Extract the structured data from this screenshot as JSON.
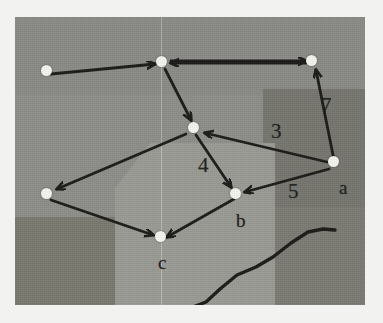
{
  "scene": {
    "description": "photograph of a hand-drawn directed graph on grey paper",
    "photo": {
      "x": 15,
      "y": 17,
      "w": 350,
      "h": 288
    },
    "background_color": "#8b8b89",
    "page_color": "#f2f2f0",
    "ink_color": "#1c1b19",
    "node_color": "#f4f4ee"
  },
  "shading_regions": [
    {
      "name": "base",
      "x": 0,
      "y": 0,
      "w": 350,
      "h": 288,
      "color": "#8d8d8a"
    },
    {
      "name": "upper-band",
      "x": 0,
      "y": 0,
      "w": 350,
      "h": 78,
      "color": "#8a8a86"
    },
    {
      "name": "right-dark-block",
      "x": 248,
      "y": 72,
      "w": 102,
      "h": 118,
      "color": "#76766f"
    },
    {
      "name": "right-lower-dark",
      "x": 248,
      "y": 190,
      "w": 102,
      "h": 98,
      "color": "#7b7b74"
    },
    {
      "name": "left-lower-dark",
      "x": 0,
      "y": 200,
      "w": 147,
      "h": 88,
      "color": "#79796f"
    },
    {
      "name": "center-light-band",
      "x": 122,
      "y": 130,
      "w": 128,
      "h": 158,
      "color": "#9a9a94"
    }
  ],
  "vertical_guide": {
    "name": "faint-vertical-crease",
    "x": 146
  },
  "graph": {
    "nodes": [
      {
        "id": "n1",
        "label": "",
        "x": 46,
        "y": 71
      },
      {
        "id": "n2",
        "label": "",
        "x": 161,
        "y": 62
      },
      {
        "id": "n3",
        "label": "",
        "x": 311,
        "y": 61
      },
      {
        "id": "n4",
        "label": "",
        "x": 193,
        "y": 128
      },
      {
        "id": "n5",
        "label": "a",
        "x": 333,
        "y": 162
      },
      {
        "id": "n6",
        "label": "",
        "x": 46,
        "y": 194
      },
      {
        "id": "n7",
        "label": "b",
        "x": 235,
        "y": 194
      },
      {
        "id": "n8",
        "label": "c",
        "x": 160,
        "y": 237
      }
    ],
    "node_labels": [
      {
        "name": "node-label-a",
        "text": "a",
        "x": 340,
        "y": 170
      },
      {
        "name": "node-label-b",
        "text": "b",
        "x": 237,
        "y": 203
      },
      {
        "name": "node-label-c",
        "text": "c",
        "x": 159,
        "y": 245
      }
    ],
    "edges": [
      {
        "from": "n1",
        "to": "n2",
        "weight": ""
      },
      {
        "from": "n3",
        "to": "n2",
        "weight": ""
      },
      {
        "from": "n2",
        "to": "n3",
        "weight": ""
      },
      {
        "from": "n2",
        "to": "n4",
        "weight": ""
      },
      {
        "from": "n5",
        "to": "n3",
        "weight": "7"
      },
      {
        "from": "n5",
        "to": "n4",
        "weight": "3"
      },
      {
        "from": "n5",
        "to": "n7",
        "weight": "5"
      },
      {
        "from": "n4",
        "to": "n7",
        "weight": "4"
      },
      {
        "from": "n4",
        "to": "n6",
        "weight": ""
      },
      {
        "from": "n6",
        "to": "n8",
        "weight": ""
      },
      {
        "from": "n7",
        "to": "n8",
        "weight": ""
      }
    ],
    "edge_weight_labels": [
      {
        "name": "edge-weight-7",
        "text": "7",
        "x": 323,
        "y": 96
      },
      {
        "name": "edge-weight-3",
        "text": "3",
        "x": 272,
        "y": 122
      },
      {
        "name": "edge-weight-4",
        "text": "4",
        "x": 199,
        "y": 156
      },
      {
        "name": "edge-weight-5",
        "text": "5",
        "x": 289,
        "y": 182
      }
    ]
  },
  "squiggle": {
    "name": "hand-drawn-squiggle",
    "points": "178,290 191,285 205,272 222,258 241,250 258,240 276,226 293,215 308,212 320,213"
  }
}
